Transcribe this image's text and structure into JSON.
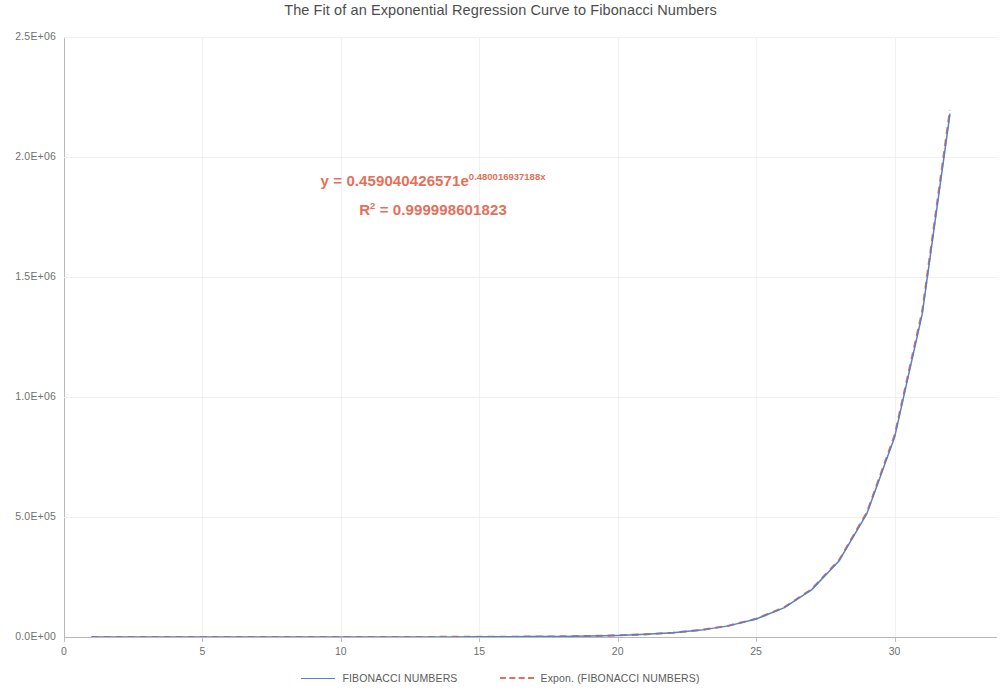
{
  "chart_data": {
    "type": "line",
    "title": "The Fit of an Exponential Regression Curve to Fibonacci Numbers",
    "xlabel": "",
    "ylabel": "",
    "xlim": [
      0,
      33.7
    ],
    "ylim": [
      0,
      2500000
    ],
    "grid": true,
    "legend_position": "bottom",
    "x_ticks": [
      "0",
      "5",
      "10",
      "15",
      "20",
      "25",
      "30"
    ],
    "x_tick_values": [
      0,
      5,
      10,
      15,
      20,
      25,
      30
    ],
    "y_ticks": [
      "0.0E+00",
      "5.0E+05",
      "1.0E+06",
      "1.5E+06",
      "2.0E+06",
      "2.5E+06"
    ],
    "y_tick_values": [
      0,
      500000,
      1000000,
      1500000,
      2000000,
      2500000
    ],
    "x": [
      1,
      2,
      3,
      4,
      5,
      6,
      7,
      8,
      9,
      10,
      11,
      12,
      13,
      14,
      15,
      16,
      17,
      18,
      19,
      20,
      21,
      22,
      23,
      24,
      25,
      26,
      27,
      28,
      29,
      30,
      31,
      32
    ],
    "series": [
      {
        "name": "FIBONACCI NUMBERS",
        "color": "#5b7fc4",
        "style": "solid",
        "values": [
          1,
          1,
          2,
          3,
          5,
          8,
          13,
          21,
          34,
          55,
          89,
          144,
          233,
          377,
          610,
          987,
          1597,
          2584,
          4181,
          6765,
          10946,
          17711,
          28657,
          46368,
          75025,
          121393,
          196418,
          317811,
          514229,
          832040,
          1346269,
          2178309
        ]
      },
      {
        "name": "Expon. (FIBONACCI NUMBERS)",
        "color": "#e3705a",
        "style": "dashed",
        "values": [
          0.7424,
          1.2006,
          1.9415,
          3.1397,
          5.0774,
          8.2113,
          13.2788,
          21.4743,
          34.7263,
          56.1566,
          90.8179,
          146.8553,
          237.4712,
          384.0283,
          621.0226,
          1004.3307,
          1624.0979,
          2626.3959,
          4247.2249,
          6868.3977,
          11108.0131,
          17961.9836,
          29046.3561,
          46967.2545,
          75949.9403,
          122817.0471,
          198605.0137,
          321164.1519,
          519334.7932,
          839830.7185,
          1358000.8871,
          2195887.5604
        ]
      }
    ],
    "annotations": {
      "equation_prefix": "y = 0.459040426571e",
      "equation_exponent": "0.480016937188x",
      "r_squared_prefix": "R",
      "r_squared_sup": "2",
      "r_squared_value": " = 0.999998601823",
      "color": "#e3705a"
    }
  },
  "legend": {
    "entries": [
      {
        "label": "FIBONACCI NUMBERS",
        "style": "solid",
        "color": "#5b7fc4"
      },
      {
        "label": "Expon. (FIBONACCI NUMBERS)",
        "style": "dashed",
        "color": "#e3705a"
      }
    ]
  },
  "colors": {
    "series_fibonacci": "#5b7fc4",
    "series_exponential": "#e3705a",
    "grid": "#f0f0f0",
    "axis": "#b8b8b8",
    "text": "#6f6f6f",
    "title": "#4d4d4d"
  }
}
